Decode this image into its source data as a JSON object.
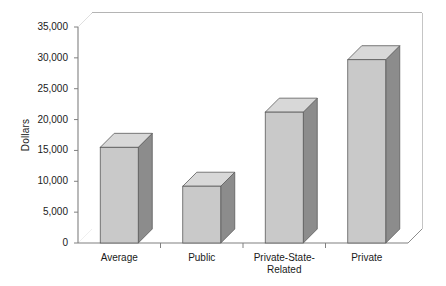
{
  "chart_data": {
    "type": "bar",
    "title": "",
    "xlabel": "",
    "ylabel": "Dollars",
    "categories": [
      "Average",
      "Public",
      "Private-State-\nRelated",
      "Private"
    ],
    "values": [
      15500,
      9200,
      21200,
      29700
    ],
    "ylim": [
      0,
      35000
    ],
    "yticks": [
      0,
      5000,
      10000,
      15000,
      20000,
      25000,
      30000,
      35000
    ],
    "ytick_labels": [
      "0",
      "5,000",
      "10,000",
      "15,000",
      "20,000",
      "25,000",
      "30,000",
      "35,000"
    ],
    "grid": true,
    "legend": false,
    "style": "3d-column",
    "colors": {
      "bar_front": "#c9c9c9",
      "bar_side": "#8c8c8c",
      "bar_top": "#d8d8d8",
      "bar_edge": "#5a5a5a",
      "gridline": "#b8b8b8",
      "axis": "#808080",
      "plot_background": "#ffffff",
      "floor": "#ffffff",
      "text": "#1a1a1a"
    }
  }
}
